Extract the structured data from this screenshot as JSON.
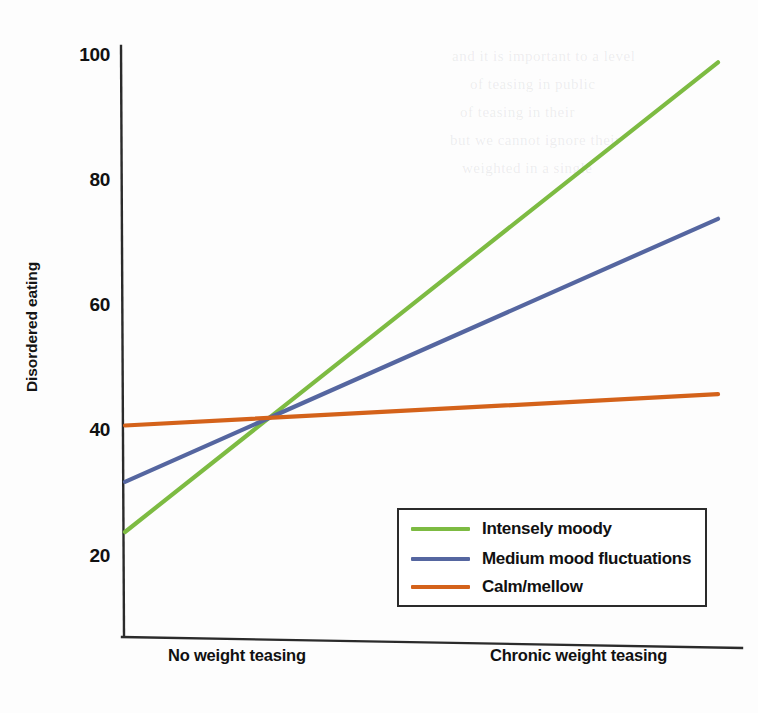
{
  "chart_data": {
    "type": "line",
    "title": "",
    "xlabel": "",
    "ylabel": "Disordered eating",
    "categories": [
      "No weight teasing",
      "Chronic weight teasing"
    ],
    "x_tick_labels": [
      "No weight teasing",
      "Chronic weight teasing"
    ],
    "y_tick_labels": [
      "100",
      "80",
      "60",
      "40",
      "20"
    ],
    "y_ticks": [
      100,
      80,
      60,
      40,
      20
    ],
    "ylim": [
      14,
      104
    ],
    "grid": false,
    "legend_position": "inside-lower-right",
    "series": [
      {
        "name": "Intensely moody",
        "color": "#7DBB42",
        "values": [
          24,
          99
        ]
      },
      {
        "name": "Medium mood fluctuations",
        "color": "#5566A0",
        "values": [
          32,
          74
        ]
      },
      {
        "name": "Calm/mellow",
        "color": "#D4621A",
        "values": [
          41,
          46
        ]
      }
    ],
    "axis_color": "#2b2b2b"
  },
  "legend": {
    "items": [
      {
        "label": "Intensely moody"
      },
      {
        "label": "Medium mood fluctuations"
      },
      {
        "label": "Calm/mellow"
      }
    ]
  },
  "ghost_text": {
    "lines": [
      "and it is important to a level",
      "of teasing in public",
      "of teasing in their",
      "but we cannot ignore their",
      "weighted in a single"
    ]
  }
}
